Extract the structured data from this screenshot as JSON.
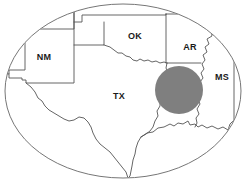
{
  "figure": {
    "type": "region-map",
    "title": "",
    "background_color": "#ffffff",
    "frame": {
      "shape": "ellipse",
      "name": "map-frame-ellipse",
      "cx": 123,
      "cy": 91,
      "rx": 118,
      "ry": 87,
      "stroke_color": "#666666",
      "fill_color": "#ffffff"
    },
    "boundary_style": {
      "stroke_color": "#555555",
      "fill_color": "#ffffff"
    }
  },
  "states": [
    {
      "code": "NM",
      "label": "NM",
      "name": "new-mexico",
      "label_x": 44,
      "label_y": 58
    },
    {
      "code": "OK",
      "label": "OK",
      "name": "oklahoma",
      "label_x": 135,
      "label_y": 37
    },
    {
      "code": "AR",
      "label": "AR",
      "name": "arkansas",
      "label_x": 190,
      "label_y": 48
    },
    {
      "code": "MS",
      "label": "MS",
      "name": "mississippi",
      "label_x": 222,
      "label_y": 78
    },
    {
      "code": "TX",
      "label": "TX",
      "name": "texas",
      "label_x": 119,
      "label_y": 97
    }
  ],
  "highlight": {
    "name": "study-area-circle",
    "shape": "circle",
    "cx": 179,
    "cy": 90,
    "r": 24,
    "fill_color": "#7f7f7f"
  }
}
